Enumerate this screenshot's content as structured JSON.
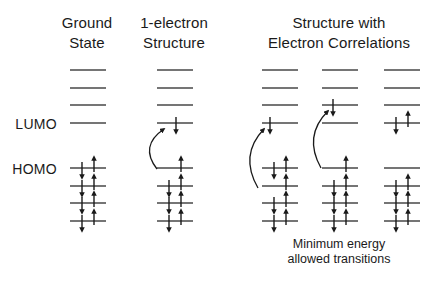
{
  "figure": {
    "background": "#ffffff",
    "ink_color": "#1a1a1a",
    "level_color": "#474747"
  },
  "headers": {
    "ground_state": {
      "lines": [
        "Ground",
        "State"
      ]
    },
    "one_electron": {
      "lines": [
        "1-electron",
        "Structure"
      ]
    },
    "electron_correlations": {
      "lines": [
        "Structure with",
        "Electron Correlations"
      ]
    }
  },
  "orbital_labels": {
    "lumo": "LUMO",
    "homo": "HOMO"
  },
  "caption": {
    "lines": [
      "Minimum energy",
      "allowed transitions"
    ]
  },
  "diagram": {
    "level_width": 36,
    "level_stroke": 1.7,
    "electron_stroke": 1.4,
    "arrow_stroke": 1.3,
    "columns": [
      {
        "name": "ground-state",
        "cx": 88,
        "levels": [
          {
            "y": 70,
            "occ": "empty"
          },
          {
            "y": 88,
            "occ": "empty"
          },
          {
            "y": 105,
            "occ": "empty"
          },
          {
            "y": 123,
            "occ": "empty"
          },
          {
            "y": 168,
            "occ": "pair"
          },
          {
            "y": 186,
            "occ": "pair"
          },
          {
            "y": 203,
            "occ": "pair"
          },
          {
            "y": 221,
            "occ": "pair"
          }
        ],
        "excitation_arrow": null
      },
      {
        "name": "one-electron-structure",
        "cx": 175,
        "levels": [
          {
            "y": 70,
            "occ": "empty"
          },
          {
            "y": 88,
            "occ": "empty"
          },
          {
            "y": 105,
            "occ": "empty"
          },
          {
            "y": 123,
            "occ": "down",
            "dx": 1
          },
          {
            "y": 168,
            "occ": "up"
          },
          {
            "y": 186,
            "occ": "pair"
          },
          {
            "y": 203,
            "occ": "pair"
          },
          {
            "y": 221,
            "occ": "pair"
          }
        ],
        "excitation_arrow": {
          "x1": 157,
          "y1": 169,
          "qx": 139,
          "qy": 146,
          "x2": 164,
          "y2": 129
        }
      },
      {
        "name": "correlation-homo1-to-lumo",
        "cx": 280,
        "levels": [
          {
            "y": 70,
            "occ": "empty"
          },
          {
            "y": 88,
            "occ": "empty"
          },
          {
            "y": 105,
            "occ": "empty"
          },
          {
            "y": 123,
            "occ": "down",
            "dx": -10
          },
          {
            "y": 168,
            "occ": "pair"
          },
          {
            "y": 186,
            "occ": "up"
          },
          {
            "y": 203,
            "occ": "pair"
          },
          {
            "y": 221,
            "occ": "pair"
          }
        ],
        "excitation_arrow": {
          "x1": 258,
          "y1": 188,
          "qx": 239,
          "qy": 155,
          "x2": 264,
          "y2": 129
        }
      },
      {
        "name": "correlation-homo-to-lumo1",
        "cx": 340,
        "levels": [
          {
            "y": 70,
            "occ": "empty"
          },
          {
            "y": 88,
            "occ": "empty"
          },
          {
            "y": 105,
            "occ": "down",
            "dx": -7
          },
          {
            "y": 123,
            "occ": "empty"
          },
          {
            "y": 168,
            "occ": "up"
          },
          {
            "y": 186,
            "occ": "pair"
          },
          {
            "y": 203,
            "occ": "pair"
          },
          {
            "y": 221,
            "occ": "pair"
          }
        ],
        "excitation_arrow": {
          "x1": 321,
          "y1": 168,
          "qx": 303,
          "qy": 136,
          "x2": 328,
          "y2": 111
        }
      },
      {
        "name": "correlation-double-excitation",
        "cx": 402,
        "levels": [
          {
            "y": 70,
            "occ": "empty"
          },
          {
            "y": 88,
            "occ": "empty"
          },
          {
            "y": 105,
            "occ": "empty"
          },
          {
            "y": 123,
            "occ": "pair"
          },
          {
            "y": 168,
            "occ": "empty"
          },
          {
            "y": 186,
            "occ": "pair"
          },
          {
            "y": 203,
            "occ": "pair"
          },
          {
            "y": 221,
            "occ": "pair"
          }
        ],
        "excitation_arrow": null
      }
    ]
  }
}
